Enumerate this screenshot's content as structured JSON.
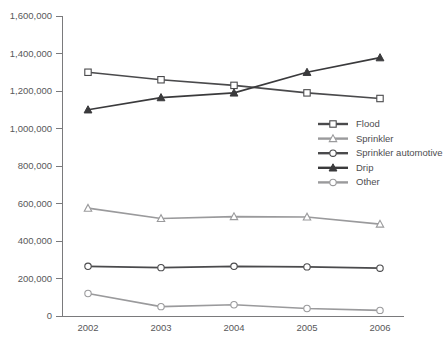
{
  "chart_data": {
    "type": "line",
    "title": "",
    "subtitle": "",
    "xlabel": "",
    "ylabel": "",
    "categories": [
      "2002",
      "2003",
      "2004",
      "2005",
      "2006"
    ],
    "x": [
      2002,
      2003,
      2004,
      2005,
      2006
    ],
    "ylim": [
      0,
      1600000
    ],
    "xlim": [
      2002,
      2006
    ],
    "grid": false,
    "legend_position": "center-right",
    "y_ticks": [
      0,
      200000,
      400000,
      600000,
      800000,
      1000000,
      1200000,
      1400000,
      1600000
    ],
    "y_tick_labels": [
      "0",
      "200,000",
      "400,000",
      "600,000",
      "800,000",
      "1,000,000",
      "1,200,000",
      "1,400,000",
      "1,600,000"
    ],
    "x_tick_labels": [
      "2002",
      "2003",
      "2004",
      "2005",
      "2006"
    ],
    "series": [
      {
        "name": "Flood",
        "marker": "open-square",
        "color": "#4a4a4c",
        "values": [
          1300000,
          1260000,
          1230000,
          1190000,
          1160000
        ]
      },
      {
        "name": "Sprinkler",
        "marker": "open-triangle",
        "color": "#9a9a9c",
        "values": [
          575000,
          520000,
          530000,
          528000,
          490000
        ]
      },
      {
        "name": "Sprinkler automotive",
        "marker": "open-circle",
        "color": "#4a4a4c",
        "values": [
          265000,
          258000,
          265000,
          262000,
          255000
        ]
      },
      {
        "name": "Drip",
        "marker": "filled-triangle",
        "color": "#3a3a3c",
        "values": [
          1100000,
          1165000,
          1190000,
          1300000,
          1378000
        ]
      },
      {
        "name": "Other",
        "marker": "open-circle",
        "color": "#9a9a9c",
        "values": [
          120000,
          50000,
          60000,
          40000,
          30000
        ]
      }
    ]
  },
  "legend": {
    "entries": [
      {
        "label": "Flood"
      },
      {
        "label": "Sprinkler"
      },
      {
        "label": "Sprinkler automotive"
      },
      {
        "label": "Drip"
      },
      {
        "label": "Other"
      }
    ]
  },
  "colors": {
    "axis": "#7a7a7c",
    "tick_text": "#58585a",
    "legend_text": "#4d4d4f",
    "dark_series": "#4a4a4c",
    "light_series": "#9a9a9c",
    "background": "#ffffff"
  }
}
